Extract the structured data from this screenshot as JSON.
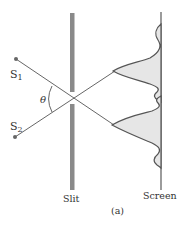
{
  "diagram": {
    "caption": "(a)",
    "labels": {
      "source1": "S",
      "source1_sub": "1",
      "source2": "S",
      "source2_sub": "2",
      "angle": "θ",
      "slit": "Slit",
      "screen": "Screen"
    },
    "colors": {
      "slit": "#8a8a8a",
      "rays": "#555555",
      "curve": "#555555",
      "fill": "#e6e6e6",
      "screen": "#666666",
      "text": "#333333"
    }
  }
}
